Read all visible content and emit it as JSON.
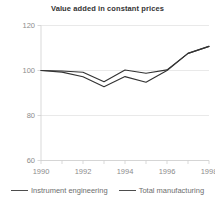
{
  "chart_data": {
    "type": "line",
    "title": "Value added in constant prices",
    "xlabel": "",
    "ylabel": "",
    "x": [
      1990,
      1991,
      1992,
      1993,
      1994,
      1995,
      1996,
      1997,
      1998
    ],
    "xlim": [
      1990,
      1998
    ],
    "ylim": [
      60,
      120
    ],
    "xticks": [
      1990,
      1991,
      1992,
      1993,
      1994,
      1995,
      1996,
      1997,
      1998
    ],
    "xtick_labels": [
      "1990",
      "",
      "1992",
      "",
      "1994",
      "",
      "1996",
      "",
      "1998"
    ],
    "yticks": [
      60,
      80,
      100,
      120
    ],
    "ytick_labels": [
      "60",
      "80",
      "100",
      "120"
    ],
    "grid": true,
    "legend_position": "bottom",
    "series": [
      {
        "name": "Instrument engineering",
        "color": "#333333",
        "values": [
          100.0,
          99.8,
          99.2,
          95.0,
          100.2,
          98.8,
          100.3,
          107.6,
          110.7
        ]
      },
      {
        "name": "Total manufacturing",
        "color": "#333333",
        "values": [
          100.0,
          99.3,
          97.2,
          92.8,
          97.3,
          94.8,
          100.0,
          107.6,
          110.7
        ]
      }
    ]
  },
  "legend": {
    "items": [
      {
        "label": "Instrument engineering"
      },
      {
        "label": "Total manufacturing"
      }
    ]
  }
}
